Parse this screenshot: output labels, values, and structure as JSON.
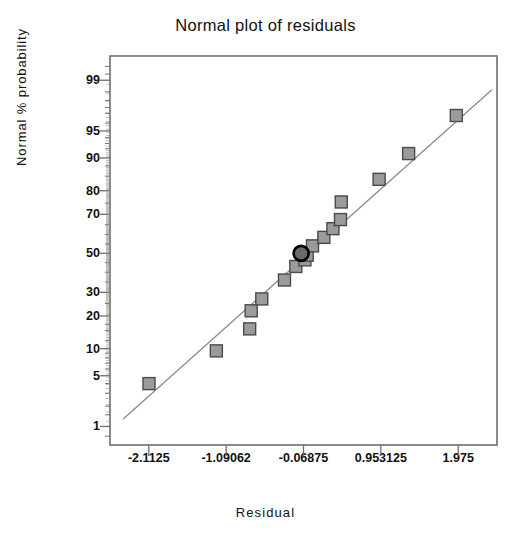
{
  "chart_data": {
    "type": "scatter",
    "title": "Normal plot of residuals",
    "xlabel": "Residual",
    "ylabel": "Normal % probability",
    "grid": false,
    "legend": null,
    "xlim": [
      -2.625,
      2.4875
    ],
    "ylim_probability": [
      0.5,
      99.6
    ],
    "x_ticks": [
      "-2.1125",
      "-1.09062",
      "-0.06875",
      "0.953125",
      "1.975"
    ],
    "x_tick_values": [
      -2.1125,
      -1.09062,
      -0.06875,
      0.953125,
      1.975
    ],
    "y_ticks": [
      "99",
      "95",
      "90",
      "80",
      "70",
      "50",
      "30",
      "20",
      "10",
      "5",
      "1"
    ],
    "y_tick_values": [
      99,
      95,
      90,
      80,
      70,
      50,
      30,
      20,
      10,
      5,
      1
    ],
    "reference_line": {
      "label": "normal reference line",
      "x_start": -2.45,
      "y_start": 1.3,
      "x_end": 2.42,
      "y_end": 98.6
    },
    "series": [
      {
        "name": "residuals",
        "marker": "square",
        "points": [
          {
            "x": -2.11,
            "y": 4.0
          },
          {
            "x": -1.22,
            "y": 9.5
          },
          {
            "x": -0.78,
            "y": 15.5
          },
          {
            "x": -0.76,
            "y": 22.0
          },
          {
            "x": -0.62,
            "y": 27.0
          },
          {
            "x": -0.32,
            "y": 36.0
          },
          {
            "x": -0.17,
            "y": 43.0
          },
          {
            "x": -0.05,
            "y": 46.5
          },
          {
            "x": -0.02,
            "y": 49.0
          },
          {
            "x": 0.05,
            "y": 54.0
          },
          {
            "x": 0.2,
            "y": 58.5
          },
          {
            "x": 0.32,
            "y": 63.0
          },
          {
            "x": 0.42,
            "y": 67.5
          },
          {
            "x": 0.43,
            "y": 75.5
          },
          {
            "x": 0.93,
            "y": 84.0
          },
          {
            "x": 1.32,
            "y": 91.0
          },
          {
            "x": 1.95,
            "y": 96.8
          }
        ]
      },
      {
        "name": "highlighted-residual",
        "marker": "circle",
        "points": [
          {
            "x": -0.1,
            "y": 50.0
          }
        ]
      }
    ]
  },
  "style": {
    "frame_color": "#6e6e6e",
    "marker_fill": "#9b9b9b",
    "marker_stroke": "#4a4a4a",
    "highlight_fill": "#6a6a6a",
    "highlight_stroke": "#000000",
    "line_color": "#8a8a8a",
    "text_color": "#111111"
  }
}
